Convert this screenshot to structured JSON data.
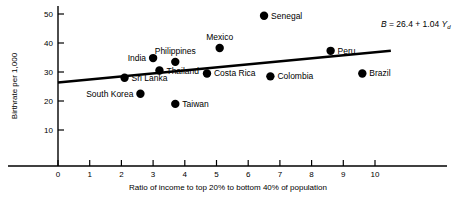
{
  "chart_data": {
    "type": "scatter",
    "title": "",
    "xlabel": "Ratio of income to top 20% to bottom 40% of population",
    "ylabel": "Birthrate per 1,000",
    "xlim": [
      0,
      10
    ],
    "ylim": [
      0,
      52
    ],
    "grid": false,
    "legend": "none",
    "xticks": [
      "0",
      "1",
      "2",
      "3",
      "4",
      "5",
      "6",
      "7",
      "8",
      "9",
      "10"
    ],
    "xtick_values": [
      0,
      1,
      2,
      3,
      4,
      5,
      6,
      7,
      8,
      9,
      10
    ],
    "yticks": [
      "10",
      "20",
      "30",
      "40",
      "50"
    ],
    "ytick_values": [
      10,
      20,
      30,
      40,
      50
    ],
    "points": [
      {
        "label": "Senegal",
        "x": 6.5,
        "y": 49.4,
        "label_side": "right"
      },
      {
        "label": "Mexico",
        "x": 5.1,
        "y": 38.3,
        "label_side": "above"
      },
      {
        "label": "Peru",
        "x": 8.6,
        "y": 37.3,
        "label_side": "right"
      },
      {
        "label": "India",
        "x": 3.0,
        "y": 34.8,
        "label_side": "left"
      },
      {
        "label": "Philippines",
        "x": 3.7,
        "y": 33.5,
        "label_side": "above"
      },
      {
        "label": "Thailand",
        "x": 3.2,
        "y": 30.5,
        "label_side": "right"
      },
      {
        "label": "Costa Rica",
        "x": 4.7,
        "y": 29.5,
        "label_side": "right"
      },
      {
        "label": "Brazil",
        "x": 9.6,
        "y": 29.5,
        "label_side": "right"
      },
      {
        "label": "Colombia",
        "x": 6.7,
        "y": 28.5,
        "label_side": "right"
      },
      {
        "label": "Sri Lanka",
        "x": 2.1,
        "y": 28.0,
        "label_side": "right"
      },
      {
        "label": "South Korea",
        "x": 2.6,
        "y": 22.5,
        "label_side": "left"
      },
      {
        "label": "Taiwan",
        "x": 3.7,
        "y": 19.0,
        "label_side": "right"
      }
    ],
    "regression": {
      "equation_text": "B = 26.4 + 1.04 Yd",
      "equation_parts": {
        "dependent": "B",
        "equals": "=",
        "intercept": "26.4",
        "plus": "+",
        "slope": "1.04",
        "independent": "Y",
        "subscript": "d"
      },
      "intercept": 26.4,
      "slope": 1.04,
      "x_start": 0,
      "x_end": 10.5,
      "y_start": 26.4,
      "y_end": 37.3
    },
    "marker": {
      "shape": "circle",
      "color": "#000000",
      "size": 4.2
    },
    "line_color": "#000000",
    "axis_color": "#000000",
    "background": "#ffffff"
  }
}
